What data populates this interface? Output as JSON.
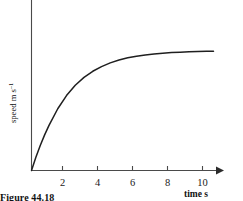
{
  "figure": {
    "caption": "Figure 44.18",
    "background_color": "#ffffff",
    "curve_color": "#1f1f1f",
    "axis_color": "#4a4a4a"
  },
  "chart_data": {
    "type": "line",
    "title": "",
    "subtitle": "",
    "xlabel": "time s",
    "ylabel": "speed m s",
    "ylabel_exponent": "–1",
    "xlim": [
      0,
      11.6
    ],
    "ylim": [
      0,
      1.28
    ],
    "grid": false,
    "legend": null,
    "x_ticks": [
      2,
      4,
      6,
      8,
      10
    ],
    "x_tick_labels": [
      "2",
      "4",
      "6",
      "8",
      "10"
    ],
    "y_ticks": [],
    "y_tick_labels": [],
    "annotations": [],
    "series": [
      {
        "name": "speed",
        "description": "exponential approach to terminal speed",
        "x": [
          0,
          0.25,
          0.5,
          0.75,
          1,
          1.5,
          2,
          2.5,
          3,
          3.5,
          4,
          4.5,
          5,
          5.5,
          6,
          6.5,
          7,
          7.5,
          8,
          8.5,
          9,
          9.5,
          10,
          10.4
        ],
        "y": [
          0,
          0.134,
          0.255,
          0.363,
          0.46,
          0.63,
          0.764,
          0.87,
          0.95,
          1.012,
          1.06,
          1.098,
          1.127,
          1.149,
          1.166,
          1.179,
          1.189,
          1.197,
          1.203,
          1.207,
          1.21,
          1.213,
          1.215,
          1.216
        ]
      }
    ]
  }
}
